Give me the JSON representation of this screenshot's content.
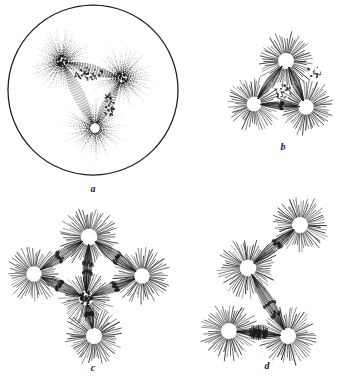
{
  "figure": {
    "background_color": "#ffffff",
    "ink_color": "#1b1b1b",
    "width": 338,
    "height": 377,
    "panels": [
      {
        "id": "a",
        "label": "a",
        "caption": "Cell with intact cell membrane containing a tripolar mitotic figure drawn in fine stipple; three asters with dark centrosomes linked by stippled spindle fibres and dark chromosome masses.",
        "style": "stippled",
        "has_cell_membrane": true,
        "aster_count": 3,
        "cell_membrane": {
          "cx": 93,
          "cy": 90,
          "rx": 85,
          "ry": 85
        },
        "asters": [
          {
            "name": "aster-upper-left",
            "cx": 62,
            "cy": 61,
            "radius": 33,
            "rays": 64,
            "core_dark": true
          },
          {
            "name": "aster-right",
            "cx": 122,
            "cy": 78,
            "radius": 33,
            "rays": 64,
            "core_dark": true
          },
          {
            "name": "aster-lower",
            "cx": 95,
            "cy": 128,
            "radius": 32,
            "rays": 64,
            "core_dark": false
          }
        ],
        "chromosome_groups": [
          {
            "name": "chromosome-plate-upper",
            "x1": 70,
            "y1": 70,
            "x2": 112,
            "y2": 80
          },
          {
            "name": "chromosome-plate-right",
            "x1": 110,
            "y1": 95,
            "x2": 106,
            "y2": 118
          }
        ]
      },
      {
        "id": "b",
        "label": "b",
        "caption": "Tripolar spindle figure. Three asters in a triangle joined by bundles of spindle fibres, chromosomes scattered between the lower two poles.",
        "style": "line",
        "has_cell_membrane": false,
        "aster_count": 3,
        "asters": [
          {
            "name": "aster-top",
            "cx": 58,
            "cy": 31,
            "radius": 28,
            "rays": 58,
            "core_dark": false
          },
          {
            "name": "aster-lower-left",
            "cx": 26,
            "cy": 74,
            "radius": 26,
            "rays": 56,
            "core_dark": false
          },
          {
            "name": "aster-lower-right",
            "cx": 78,
            "cy": 77,
            "radius": 27,
            "rays": 56,
            "core_dark": false
          }
        ],
        "spindles": [
          {
            "name": "spindle-top-to-lower-left",
            "from": 0,
            "to": 1,
            "fibers": 9
          },
          {
            "name": "spindle-top-to-lower-right",
            "from": 0,
            "to": 2,
            "fibers": 9
          },
          {
            "name": "spindle-lower-left-to-right",
            "from": 1,
            "to": 2,
            "fibers": 7
          }
        ]
      },
      {
        "id": "c",
        "label": "c",
        "caption": "Tetrapolar spindle figure. Four asters set at the corners of a rhombus, every pole joined to its neighbours by arched bundles of spindle fibres bearing dark chromosomes.",
        "style": "line",
        "has_cell_membrane": false,
        "aster_count": 4,
        "asters": [
          {
            "name": "aster-top",
            "cx": 81,
            "cy": 31,
            "radius": 29,
            "rays": 62,
            "core_dark": false
          },
          {
            "name": "aster-left",
            "cx": 26,
            "cy": 68,
            "radius": 27,
            "rays": 58,
            "core_dark": false
          },
          {
            "name": "aster-right",
            "cx": 134,
            "cy": 70,
            "radius": 27,
            "rays": 58,
            "core_dark": false
          },
          {
            "name": "aster-bottom",
            "cx": 86,
            "cy": 130,
            "radius": 28,
            "rays": 60,
            "core_dark": false
          },
          {
            "name": "aster-center",
            "cx": 78,
            "cy": 92,
            "radius": 26,
            "rays": 56,
            "core_dark": true
          }
        ],
        "spindles": [
          {
            "name": "spindle-top-to-left",
            "fibers": 9
          },
          {
            "name": "spindle-top-to-right",
            "fibers": 9
          },
          {
            "name": "spindle-left-to-center",
            "fibers": 9
          },
          {
            "name": "spindle-right-to-center",
            "fibers": 9
          },
          {
            "name": "spindle-top-to-center",
            "fibers": 9
          },
          {
            "name": "spindle-center-to-bottom",
            "fibers": 8
          }
        ]
      },
      {
        "id": "d",
        "label": "d",
        "caption": "Irregular tetrapolar figure. Four asters arranged in a bent chain; a broad banded chromosome plate lies between the two lower poles.",
        "style": "line",
        "has_cell_membrane": false,
        "aster_count": 4,
        "asters": [
          {
            "name": "aster-upper-right",
            "cx": 104,
            "cy": 29,
            "radius": 28,
            "rays": 58,
            "core_dark": false
          },
          {
            "name": "aster-middle-left",
            "cx": 52,
            "cy": 72,
            "radius": 29,
            "rays": 60,
            "core_dark": false
          },
          {
            "name": "aster-lower-left",
            "cx": 33,
            "cy": 135,
            "radius": 28,
            "rays": 58,
            "core_dark": false
          },
          {
            "name": "aster-lower-right",
            "cx": 92,
            "cy": 140,
            "radius": 28,
            "rays": 58,
            "core_dark": false
          }
        ],
        "spindles": [
          {
            "name": "spindle-upper-right-to-middle-left",
            "fibers": 9
          },
          {
            "name": "spindle-middle-left-to-lower-right",
            "fibers": 10
          },
          {
            "name": "spindle-lower-left-to-lower-right",
            "fibers": 9
          }
        ],
        "chromosome_groups": [
          {
            "name": "chromosome-plate-lower",
            "note": "dark banded equatorial plate between lower poles"
          }
        ]
      }
    ]
  }
}
